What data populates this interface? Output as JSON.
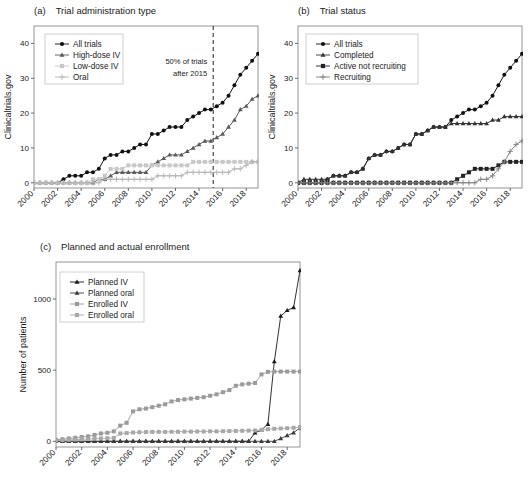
{
  "figure": {
    "panels": [
      "a",
      "b",
      "c"
    ]
  },
  "panel_a": {
    "tag": "(a)",
    "title": "Trial administration type",
    "annotation": {
      "line1": "50% of trials",
      "line2": "after 2015",
      "x_year": 2015.2
    },
    "chart_data": {
      "type": "line",
      "title": "Trial administration type",
      "xlabel": "",
      "ylabel": "Clinicaltrials.gov",
      "xlim": [
        2000,
        2019
      ],
      "ylim": [
        -1.5,
        45
      ],
      "yticks": [
        0,
        10,
        20,
        30,
        40
      ],
      "xticks": [
        2000,
        2002,
        2004,
        2006,
        2008,
        2010,
        2012,
        2014,
        2016,
        2018
      ],
      "grid": false,
      "legend_position": "top-left",
      "x": [
        2000,
        2000.5,
        2001,
        2001.5,
        2002,
        2002.5,
        2003,
        2003.5,
        2004,
        2004.5,
        2005,
        2005.5,
        2006,
        2006.5,
        2007,
        2007.5,
        2008,
        2008.5,
        2009,
        2009.5,
        2010,
        2010.5,
        2011,
        2011.5,
        2012,
        2012.5,
        2013,
        2013.5,
        2014,
        2014.5,
        2015,
        2015.5,
        2016,
        2016.5,
        2017,
        2017.5,
        2018,
        2018.5,
        2019
      ],
      "series": [
        {
          "name": "All trials",
          "marker": "circle",
          "color": "#111111",
          "values": [
            0,
            0,
            0,
            0,
            0,
            1,
            2,
            2,
            2,
            3,
            3,
            4,
            7,
            8,
            8,
            9,
            9,
            10,
            11,
            11,
            14,
            14,
            15,
            16,
            16,
            16,
            18,
            19,
            20,
            21,
            21,
            22,
            23,
            25,
            28,
            31,
            33,
            35,
            37
          ]
        },
        {
          "name": "High-dose IV",
          "marker": "triangle",
          "color": "#5a5a5a",
          "values": [
            0,
            0,
            0,
            0,
            0,
            0,
            0,
            0,
            0,
            0,
            0,
            1,
            1,
            2,
            3,
            3,
            3,
            3,
            3,
            3,
            5,
            6,
            7,
            8,
            8,
            8,
            9,
            10,
            11,
            12,
            12,
            13,
            14,
            16,
            18,
            21,
            22,
            24,
            25
          ]
        },
        {
          "name": "Low-dose IV",
          "marker": "square",
          "color": "#c8c8c8",
          "values": [
            0,
            0,
            0,
            0,
            0,
            0,
            0,
            0,
            0,
            0,
            1,
            1,
            2,
            4,
            4,
            4,
            5,
            5,
            5,
            5,
            5,
            5,
            5,
            5,
            5,
            5,
            5,
            6,
            6,
            6,
            6,
            6,
            6,
            6,
            6,
            6,
            6,
            6,
            6
          ]
        },
        {
          "name": "Oral",
          "marker": "plus",
          "color": "#b4b4b4",
          "values": [
            0,
            0,
            0,
            0,
            0,
            0,
            0,
            0,
            0,
            0,
            0,
            0,
            1,
            1,
            1,
            1,
            1,
            1,
            1,
            1,
            1,
            2,
            2,
            2,
            2,
            2,
            3,
            3,
            3,
            3,
            3,
            3,
            3,
            3,
            4,
            4,
            5,
            6,
            6
          ]
        }
      ]
    }
  },
  "panel_b": {
    "tag": "(b)",
    "title": "Trial status",
    "chart_data": {
      "type": "line",
      "title": "Trial status",
      "xlabel": "",
      "ylabel": "Clinicaltrials.gov",
      "xlim": [
        2000,
        2019
      ],
      "ylim": [
        -1.5,
        45
      ],
      "yticks": [
        0,
        10,
        20,
        30,
        40
      ],
      "xticks": [
        2000,
        2002,
        2004,
        2006,
        2008,
        2010,
        2012,
        2014,
        2016,
        2018
      ],
      "grid": false,
      "legend_position": "top-left",
      "x": [
        2000,
        2000.5,
        2001,
        2001.5,
        2002,
        2002.5,
        2003,
        2003.5,
        2004,
        2004.5,
        2005,
        2005.5,
        2006,
        2006.5,
        2007,
        2007.5,
        2008,
        2008.5,
        2009,
        2009.5,
        2010,
        2010.5,
        2011,
        2011.5,
        2012,
        2012.5,
        2013,
        2013.5,
        2014,
        2014.5,
        2015,
        2015.5,
        2016,
        2016.5,
        2017,
        2017.5,
        2018,
        2018.5,
        2019
      ],
      "series": [
        {
          "name": "All trials",
          "marker": "circle",
          "color": "#111111",
          "values": [
            0,
            0,
            0,
            0,
            0,
            1,
            2,
            2,
            2,
            3,
            3,
            4,
            7,
            8,
            8,
            9,
            9,
            10,
            11,
            11,
            14,
            14,
            15,
            16,
            16,
            16,
            18,
            19,
            20,
            21,
            21,
            22,
            23,
            25,
            28,
            31,
            33,
            35,
            37
          ]
        },
        {
          "name": "Completed",
          "marker": "triangle",
          "color": "#333333",
          "values": [
            0,
            1,
            1,
            1,
            1,
            1,
            2,
            2,
            2,
            3,
            3,
            4,
            7,
            8,
            8,
            9,
            9,
            10,
            11,
            11,
            14,
            14,
            15,
            16,
            16,
            16,
            17,
            17,
            17,
            17,
            17,
            17,
            17,
            18,
            18,
            19,
            19,
            19,
            19
          ]
        },
        {
          "name": "Active not recruiting",
          "marker": "square",
          "color": "#222222",
          "values": [
            0,
            0,
            0,
            0,
            0,
            0,
            0,
            0,
            0,
            0,
            0,
            0,
            0,
            0,
            0,
            0,
            0,
            0,
            0,
            0,
            0,
            0,
            0,
            0,
            0,
            0,
            0,
            1,
            2,
            3,
            4,
            4,
            4,
            4,
            5,
            6,
            6,
            6,
            6
          ]
        },
        {
          "name": "Recruiting",
          "marker": "plus",
          "color": "#808080",
          "values": [
            0,
            0,
            0,
            0,
            0,
            0,
            0,
            0,
            0,
            0,
            0,
            0,
            0,
            0,
            0,
            0,
            0,
            0,
            0,
            0,
            0,
            0,
            0,
            0,
            0,
            0,
            0,
            0,
            0,
            0,
            0,
            1,
            1,
            2,
            4,
            6,
            9,
            11,
            12
          ]
        }
      ]
    }
  },
  "panel_c": {
    "tag": "(c)",
    "title": "Planned and actual enrollment",
    "chart_data": {
      "type": "line",
      "title": "Planned and actual enrollment",
      "xlabel": "",
      "ylabel": "Number of patients",
      "xlim": [
        2000,
        2019
      ],
      "ylim": [
        -40,
        1260
      ],
      "yticks": [
        0,
        500,
        1000
      ],
      "xticks": [
        2000,
        2002,
        2004,
        2006,
        2008,
        2010,
        2012,
        2014,
        2016,
        2018
      ],
      "grid": false,
      "legend_position": "top-left",
      "x": [
        2000,
        2000.5,
        2001,
        2001.5,
        2002,
        2002.5,
        2003,
        2003.5,
        2004,
        2004.5,
        2005,
        2005.5,
        2006,
        2006.5,
        2007,
        2007.5,
        2008,
        2008.5,
        2009,
        2009.5,
        2010,
        2010.5,
        2011,
        2011.5,
        2012,
        2012.5,
        2013,
        2013.5,
        2014,
        2014.5,
        2015,
        2015.5,
        2016,
        2016.5,
        2017,
        2017.5,
        2018,
        2018.5,
        2019
      ],
      "series": [
        {
          "name": "Planned IV",
          "marker": "triangle",
          "color": "#1a1a1a",
          "values": [
            0,
            0,
            0,
            0,
            0,
            0,
            0,
            0,
            0,
            0,
            0,
            0,
            0,
            0,
            0,
            0,
            0,
            0,
            0,
            0,
            0,
            0,
            0,
            0,
            0,
            0,
            0,
            0,
            0,
            0,
            0,
            60,
            80,
            120,
            560,
            880,
            920,
            940,
            1200
          ]
        },
        {
          "name": "Planned oral",
          "marker": "triangle",
          "color": "#3a3a3a",
          "values": [
            0,
            0,
            0,
            0,
            0,
            0,
            0,
            0,
            0,
            0,
            0,
            0,
            0,
            0,
            0,
            0,
            0,
            0,
            0,
            0,
            0,
            0,
            0,
            0,
            0,
            0,
            0,
            0,
            0,
            0,
            0,
            0,
            0,
            0,
            0,
            20,
            40,
            60,
            95
          ]
        },
        {
          "name": "Enrolled IV",
          "marker": "square",
          "color": "#9a9a9a",
          "values": [
            10,
            15,
            20,
            25,
            30,
            35,
            45,
            55,
            60,
            70,
            110,
            130,
            210,
            225,
            230,
            240,
            250,
            260,
            280,
            290,
            295,
            300,
            305,
            310,
            320,
            330,
            345,
            360,
            390,
            400,
            405,
            410,
            470,
            488,
            490,
            490,
            490,
            490,
            490
          ]
        },
        {
          "name": "Enrolled oral",
          "marker": "square",
          "color": "#a8a8a8",
          "values": [
            5,
            8,
            10,
            12,
            14,
            16,
            18,
            20,
            22,
            24,
            55,
            58,
            62,
            64,
            65,
            66,
            66,
            66,
            67,
            67,
            68,
            68,
            69,
            69,
            70,
            70,
            71,
            72,
            73,
            74,
            75,
            76,
            80,
            85,
            88,
            90,
            92,
            95,
            100
          ]
        }
      ]
    }
  }
}
